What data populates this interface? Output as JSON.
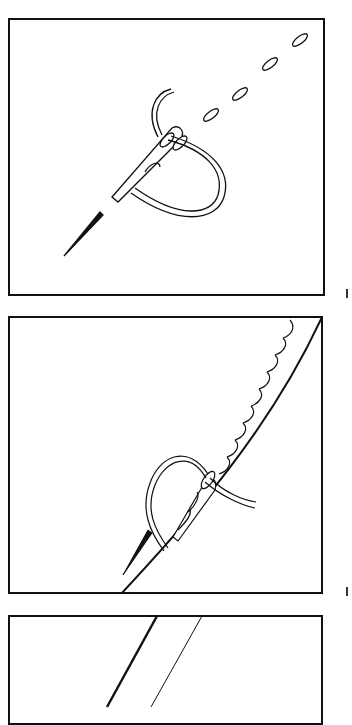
{
  "figure": {
    "panels": [
      {
        "id": 1,
        "label": "step-1",
        "content": "needle pulling thread through, running stitches ahead"
      },
      {
        "id": 2,
        "label": "step-2",
        "content": "stitches worked along a curved edge line"
      },
      {
        "id": 3,
        "label": "step-3",
        "content": "two parallel diagonal lines (partially cropped)"
      }
    ],
    "colors": {
      "line": "#111111",
      "background": "#ffffff"
    }
  }
}
